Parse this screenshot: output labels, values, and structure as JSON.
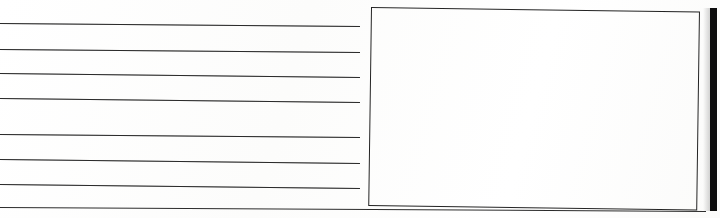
{
  "document": {
    "kind": "scanned-form-page",
    "background_color": "#ffffff",
    "ink_color": "#2b2b2b",
    "gutter_color": "#0d0d0d",
    "width": 720,
    "height": 218
  },
  "writing_lines": {
    "count": 7,
    "label": "ruled writing line",
    "left_x": 0,
    "right_x": 360,
    "items": [
      {
        "y_left": 23,
        "y_right": 26
      },
      {
        "y_left": 49,
        "y_right": 52
      },
      {
        "y_left": 73,
        "y_right": 77
      },
      {
        "y_left": 98,
        "y_right": 102
      },
      {
        "y_left": 134,
        "y_right": 137
      },
      {
        "y_left": 159,
        "y_right": 163
      },
      {
        "y_left": 184,
        "y_right": 188
      }
    ]
  },
  "answer_box": {
    "label": "empty bordered box",
    "x": 371,
    "y": 7,
    "width": 327,
    "height": 197,
    "rotation_deg": 0.8,
    "content": ""
  },
  "baseline": {
    "label": "bottom rule",
    "y_left": 207,
    "y_right": 211,
    "left_x": 0,
    "right_x": 706
  },
  "gutter": {
    "label": "page edge bar",
    "x": 710,
    "y": 8,
    "width": 7,
    "height": 203
  }
}
